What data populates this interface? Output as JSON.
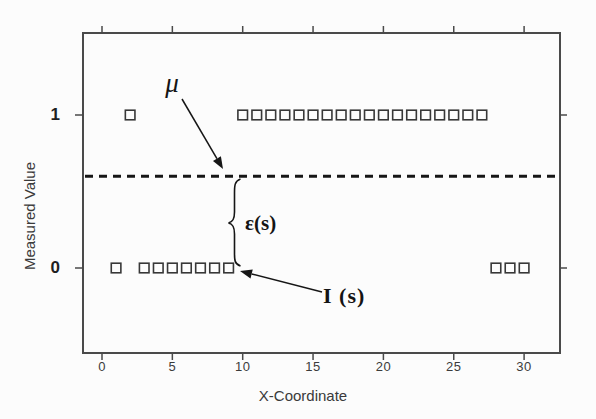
{
  "colors": {
    "background": "#fcfcfc",
    "axis": "#4a4a4a",
    "marker_stroke": "#383838",
    "ink": "#161616",
    "tick_text": "#3b3b3b"
  },
  "chart_data": {
    "type": "scatter",
    "title": "",
    "xlabel": "X-Coordinate",
    "ylabel": "Measured Value",
    "marker": "open-square",
    "grid": false,
    "xlim": [
      -1.5,
      32.5
    ],
    "ylim": [
      -0.55,
      1.55
    ],
    "x_ticks": [
      {
        "label": "0",
        "value": 0
      },
      {
        "label": "5",
        "value": 5
      },
      {
        "label": "10",
        "value": 10
      },
      {
        "label": "15",
        "value": 15
      },
      {
        "label": "20",
        "value": 20
      },
      {
        "label": "25",
        "value": 25
      },
      {
        "label": "30",
        "value": 30
      }
    ],
    "y_ticks": [
      {
        "label": "1",
        "value": 1
      },
      {
        "label": "0",
        "value": 0
      }
    ],
    "series": [
      {
        "name": "measured-value-1",
        "value": 1,
        "x": [
          2,
          10,
          11,
          12,
          13,
          14,
          15,
          16,
          17,
          18,
          19,
          20,
          21,
          22,
          23,
          24,
          25,
          26,
          27
        ]
      },
      {
        "name": "measured-value-0",
        "value": 0,
        "x": [
          1,
          3,
          4,
          5,
          6,
          7,
          8,
          9,
          28,
          29,
          30
        ]
      }
    ],
    "mean_line": {
      "y": 0.6,
      "style": "dashed"
    },
    "annotations": {
      "mu": "μ",
      "epsilon": "ε(s)",
      "indicator": "I (s)"
    }
  }
}
